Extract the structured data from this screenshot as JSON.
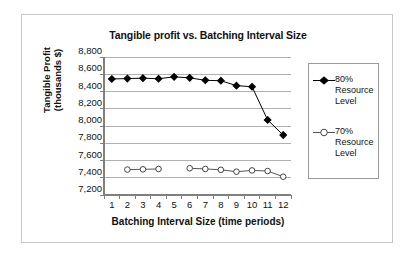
{
  "chart_data": {
    "type": "line",
    "title": "Tangible profit vs. Batching Interval Size",
    "xlabel": "Batching Interval Size (time periods)",
    "ylabel": "Tangible Profit (thousands $)",
    "ylabel_line1": "Tangible Profit",
    "ylabel_line2": "(thousands $)",
    "x": [
      1,
      2,
      3,
      4,
      5,
      6,
      7,
      8,
      9,
      10,
      11,
      12
    ],
    "categories": [
      "1",
      "2",
      "3",
      "4",
      "5",
      "6",
      "7",
      "8",
      "9",
      "10",
      "11",
      "12"
    ],
    "ylim": [
      7200,
      8800
    ],
    "ytick_values": [
      7200,
      7400,
      7600,
      7800,
      8000,
      8200,
      8400,
      8600,
      8800
    ],
    "ytick_labels": [
      "7,200",
      "7,400",
      "7,600",
      "7,800",
      "8,000",
      "8,200",
      "8,400",
      "8,600",
      "8,800"
    ],
    "grid": "horizontal",
    "legend_position": "right",
    "series": [
      {
        "name": "80% Resource Level",
        "legend_line1": "80%",
        "legend_line2": "Resource",
        "legend_line3": "Level",
        "marker": "filled-diamond",
        "color": "#000000",
        "values": [
          8545,
          8550,
          8555,
          8548,
          8570,
          8558,
          8530,
          8525,
          8468,
          8455,
          8070,
          7895
        ]
      },
      {
        "name": "70% Resource Level",
        "legend_line1": "70%",
        "legend_line2": "Resource",
        "legend_line3": "Level",
        "marker": "open-circle",
        "color": "#555555",
        "values": [
          null,
          7495,
          7498,
          7502,
          null,
          7510,
          7502,
          7492,
          7470,
          7485,
          7478,
          7412
        ]
      }
    ]
  },
  "colors": {
    "frame_border": "#c8c8c8",
    "axis": "#808080",
    "gridline": "#b0b0b0",
    "legend_border": "#9a9a9a",
    "series_80": "#000000",
    "series_70": "#555555",
    "background": "#ffffff"
  }
}
